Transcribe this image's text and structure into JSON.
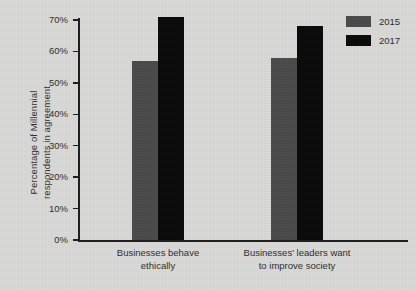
{
  "chart_data": {
    "type": "bar",
    "title": "",
    "subtitle": "",
    "xlabel": "",
    "ylabel": "Percentage of Millennial respondents in agreement",
    "ylabel_lines": [
      "Percentage of Millennial",
      "respondents in agreement"
    ],
    "categories": [
      "Businesses behave ethically",
      "Businesses' leaders want to improve society"
    ],
    "category_lines": [
      [
        "Businesses behave",
        "ethically"
      ],
      [
        "Businesses' leaders want",
        "to improve society"
      ]
    ],
    "series": [
      {
        "name": "2015",
        "color": "#4a4a4a",
        "values": [
          57,
          58
        ]
      },
      {
        "name": "2017",
        "color": "#0a0a0a",
        "values": [
          71,
          68
        ]
      }
    ],
    "ylim": [
      0,
      70
    ],
    "ytick_values": [
      0,
      10,
      20,
      30,
      40,
      50,
      60,
      70
    ],
    "ytick_labels": [
      "0%",
      "10%",
      "20%",
      "30%",
      "40%",
      "50%",
      "60%",
      "70%"
    ],
    "grid": false,
    "legend_position": "top-right",
    "legend_entries": [
      "2015",
      "2017"
    ],
    "background_color": "#d8d8d6",
    "axis_color": "#1d1d1d",
    "text_color": "#2e2e2e"
  }
}
